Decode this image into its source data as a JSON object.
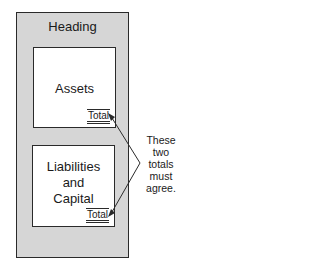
{
  "diagram": {
    "outer_heading": "Heading",
    "top_section": {
      "label": "Assets",
      "total_label": "Total"
    },
    "bottom_section": {
      "label_lines": [
        "Liabilities",
        "and",
        "Capital"
      ],
      "total_label": "Total"
    },
    "annotation_lines": [
      "These",
      "two",
      "totals",
      "must",
      "agree."
    ],
    "colors": {
      "frame_fill": "#d6d6d6",
      "inner_fill": "#ffffff",
      "stroke": "#2a2a2a"
    }
  }
}
